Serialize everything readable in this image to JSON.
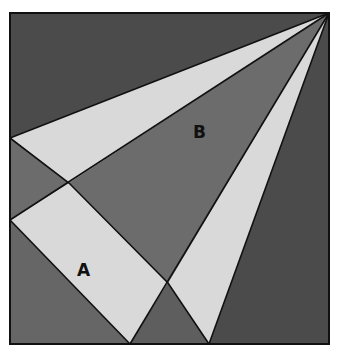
{
  "figure": {
    "labels": {
      "a": "A",
      "b": "B"
    },
    "colors": {
      "dark": "#4b4b4b",
      "medium": "#6c6c6c",
      "light": "#d9d9d9",
      "stroke": "#111111"
    }
  }
}
